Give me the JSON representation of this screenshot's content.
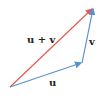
{
  "diagram": {
    "type": "vector-addition",
    "vectors": [
      {
        "name": "u",
        "label": "u",
        "from": [
          10,
          87
        ],
        "to": [
          82,
          63
        ],
        "color": "#5b8fd0"
      },
      {
        "name": "v",
        "label": "v",
        "from": [
          82,
          63
        ],
        "to": [
          93,
          8
        ],
        "color": "#5b8fd0"
      },
      {
        "name": "u-plus-v",
        "label": "u + v",
        "from": [
          10,
          87
        ],
        "to": [
          93,
          8
        ],
        "color": "#e8584a"
      }
    ]
  }
}
